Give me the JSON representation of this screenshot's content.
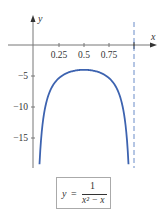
{
  "chart_data": {
    "type": "line",
    "title": "",
    "formula": {
      "lhs": "y",
      "eq": "=",
      "numerator": "1",
      "denominator": "x² − x"
    },
    "xlabel": "x",
    "ylabel": "y",
    "x_ticks": [
      "0.25",
      "0.5",
      "0.75"
    ],
    "x_tick_values": [
      0.25,
      0.5,
      0.75,
      1
    ],
    "y_ticks": [
      "−5",
      "−10",
      "−15"
    ],
    "y_tick_values": [
      -5,
      -10,
      -15
    ],
    "xlim": [
      -0.33,
      1.27
    ],
    "ylim": [
      -19.5,
      7.2
    ],
    "asymptote_x": 1,
    "series": [
      {
        "name": "y = 1/(x^2 - x)",
        "color": "#3d63b0",
        "x": [
          0.055,
          0.07,
          0.1,
          0.15,
          0.2,
          0.25,
          0.3,
          0.4,
          0.5,
          0.6,
          0.7,
          0.75,
          0.8,
          0.85,
          0.9,
          0.93,
          0.945
        ],
        "y": [
          -19.2,
          -15.4,
          -11.1,
          -7.8,
          -6.25,
          -5.33,
          -4.76,
          -4.17,
          -4.0,
          -4.17,
          -4.76,
          -5.33,
          -6.25,
          -7.8,
          -11.1,
          -15.4,
          -19.2
        ]
      }
    ],
    "grid": false
  }
}
